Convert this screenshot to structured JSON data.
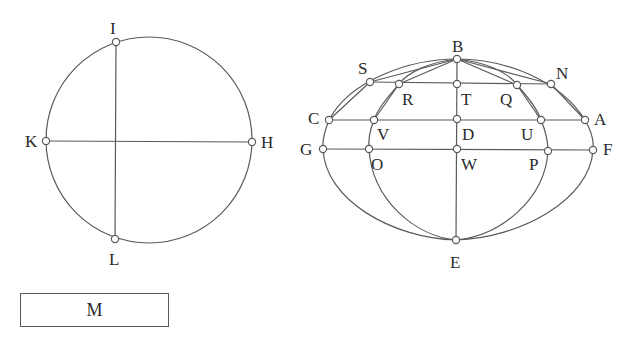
{
  "top_fragment_text": "",
  "left_figure": {
    "circle": {
      "cx": 149,
      "cy": 140,
      "r": 103
    },
    "points": [
      {
        "label": "I",
        "x": 116,
        "y": 42,
        "lx": 110,
        "ly": 34
      },
      {
        "label": "K",
        "x": 46,
        "y": 141,
        "lx": 25,
        "ly": 147
      },
      {
        "label": "H",
        "x": 252,
        "y": 142,
        "lx": 261,
        "ly": 148
      },
      {
        "label": "L",
        "x": 115,
        "y": 239,
        "lx": 109,
        "ly": 265
      }
    ]
  },
  "right_figure": {
    "points": [
      {
        "label": "B",
        "x": 457,
        "y": 59,
        "lx": 452,
        "ly": 52
      },
      {
        "label": "S",
        "x": 370,
        "y": 82,
        "lx": 358,
        "ly": 74
      },
      {
        "label": "R",
        "x": 399,
        "y": 84,
        "lx": 402,
        "ly": 105
      },
      {
        "label": "T",
        "x": 457,
        "y": 84,
        "lx": 461,
        "ly": 105
      },
      {
        "label": "Q",
        "x": 517,
        "y": 85,
        "lx": 500,
        "ly": 105
      },
      {
        "label": "N",
        "x": 551,
        "y": 84,
        "lx": 556,
        "ly": 79
      },
      {
        "label": "C",
        "x": 329,
        "y": 120,
        "lx": 308,
        "ly": 124
      },
      {
        "label": "V",
        "x": 374,
        "y": 120,
        "lx": 377,
        "ly": 140
      },
      {
        "label": "D",
        "x": 457,
        "y": 119,
        "lx": 462,
        "ly": 140
      },
      {
        "label": "U",
        "x": 541,
        "y": 120,
        "lx": 521,
        "ly": 140
      },
      {
        "label": "A",
        "x": 585,
        "y": 120,
        "lx": 594,
        "ly": 125
      },
      {
        "label": "G",
        "x": 323,
        "y": 149,
        "lx": 300,
        "ly": 155
      },
      {
        "label": "O",
        "x": 369,
        "y": 149,
        "lx": 371,
        "ly": 170
      },
      {
        "label": "W",
        "x": 457,
        "y": 149,
        "lx": 461,
        "ly": 170
      },
      {
        "label": "P",
        "x": 548,
        "y": 151,
        "lx": 529,
        "ly": 170
      },
      {
        "label": "F",
        "x": 593,
        "y": 150,
        "lx": 603,
        "ly": 155
      },
      {
        "label": "E",
        "x": 456,
        "y": 240,
        "lx": 450,
        "ly": 268
      }
    ]
  },
  "box": {
    "label": "M"
  }
}
